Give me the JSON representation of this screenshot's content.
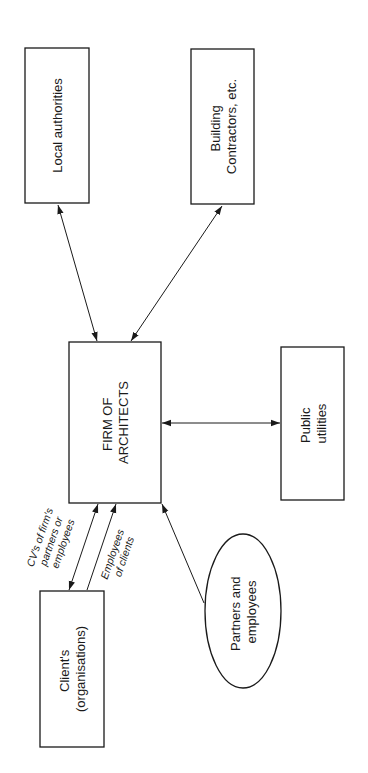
{
  "diagram": {
    "orientation": "rotated-90-ccw",
    "nodes": {
      "local_authorities": {
        "lines": [
          "Local authorities"
        ]
      },
      "building_contractors": {
        "lines": [
          "Building",
          "Contractors, etc."
        ]
      },
      "firm_of_architects": {
        "lines": [
          "FIRM OF",
          "ARCHITECTS"
        ]
      },
      "public_utilities": {
        "lines": [
          "Public",
          "utilities"
        ]
      },
      "clients": {
        "lines": [
          "Client's",
          "(organisations)"
        ]
      },
      "partners_employees": {
        "lines": [
          "Partners and",
          "employees"
        ]
      }
    },
    "edge_labels": {
      "cvs": [
        "CV's of firm's",
        "partners or",
        "employees"
      ],
      "employees_of_clients": [
        "Employees",
        "of clients"
      ]
    },
    "edges": [
      {
        "from": "firm_of_architects",
        "to": "local_authorities",
        "direction": "both"
      },
      {
        "from": "firm_of_architects",
        "to": "building_contractors",
        "direction": "both"
      },
      {
        "from": "firm_of_architects",
        "to": "public_utilities",
        "direction": "both"
      },
      {
        "from": "clients",
        "to": "firm_of_architects",
        "direction": "both",
        "label": "CV's of firm's partners or employees"
      },
      {
        "from": "clients",
        "to": "firm_of_architects",
        "direction": "forward",
        "label": "Employees of clients"
      },
      {
        "from": "partners_employees",
        "to": "firm_of_architects",
        "direction": "forward"
      }
    ]
  }
}
